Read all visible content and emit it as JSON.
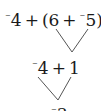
{
  "diagram": {
    "type": "evaluation-tree",
    "rows": [
      {
        "expression": "-4 + (6 + -5)",
        "parts": {
          "a_sign": "⁻",
          "a": "4",
          "op1": "+",
          "open": "(",
          "b": "6",
          "op2": "+",
          "c_sign": "⁻",
          "c": "5",
          "close": ")"
        }
      },
      {
        "expression": "-4 + 1",
        "parts": {
          "a_sign": "⁻",
          "a": "4",
          "op1": "+",
          "b": "1"
        }
      },
      {
        "expression": "-3",
        "parts": {
          "a_sign": "⁻",
          "a": "3"
        }
      }
    ],
    "edges": [
      {
        "from": "row0:6",
        "to": "row1:1"
      },
      {
        "from": "row0:5)",
        "to": "row1:1"
      },
      {
        "from": "row1:-4",
        "to": "row2:-3"
      },
      {
        "from": "row1:1",
        "to": "row2:-3"
      }
    ],
    "line_color": "#555555",
    "text_color": "#1a1a1a"
  }
}
